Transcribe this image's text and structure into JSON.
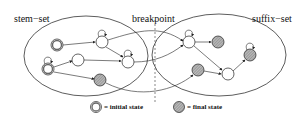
{
  "diagram": {
    "labels": {
      "stem_set": "stem−set",
      "breakpoint": "breakpoint",
      "suffix_set": "suffix−set"
    },
    "legend": {
      "initial_state": "= initial state",
      "final_state": "= final state"
    },
    "regions": [
      {
        "id": "stem-set",
        "cx": 86,
        "cy": 56,
        "rx": 62,
        "ry": 40
      },
      {
        "id": "suffix-set",
        "cx": 219,
        "cy": 55,
        "rx": 67,
        "ry": 41
      }
    ],
    "nodes": [
      {
        "id": "s1",
        "type": "initial",
        "x": 57,
        "y": 45
      },
      {
        "id": "s2",
        "type": "normal",
        "x": 102,
        "y": 42,
        "self_loop": true
      },
      {
        "id": "s3",
        "type": "normal",
        "x": 128,
        "y": 62,
        "self_loop": true
      },
      {
        "id": "s4",
        "type": "normal",
        "x": 78,
        "y": 60
      },
      {
        "id": "s5",
        "type": "initial",
        "x": 48,
        "y": 69,
        "self_loop": true
      },
      {
        "id": "s6",
        "type": "final",
        "x": 100,
        "y": 80
      },
      {
        "id": "t1",
        "type": "normal",
        "x": 189,
        "y": 42,
        "self_loop": true
      },
      {
        "id": "t2",
        "type": "final",
        "x": 218,
        "y": 42
      },
      {
        "id": "t3",
        "type": "final",
        "x": 250,
        "y": 55,
        "self_loop": true
      },
      {
        "id": "t4",
        "type": "normal",
        "x": 228,
        "y": 74
      },
      {
        "id": "t5",
        "type": "final",
        "x": 198,
        "y": 70
      }
    ]
  }
}
